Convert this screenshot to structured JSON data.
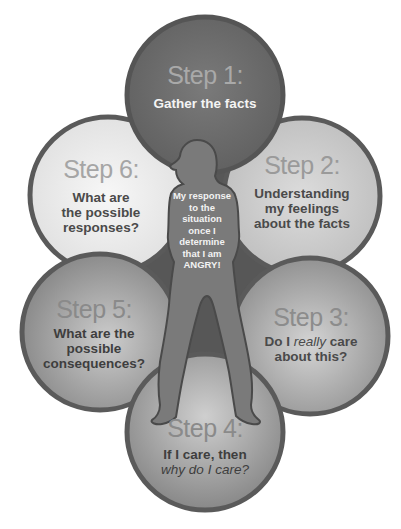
{
  "diagram": {
    "center": {
      "lines": [
        "My response",
        "to the",
        "situation",
        "once I",
        "determine",
        "that I am",
        "ANGRY!"
      ]
    },
    "steps": [
      {
        "number": "Step 1:",
        "lines": [
          "Gather the facts"
        ],
        "fill": "#6e6e6e",
        "text_color": "#f4f4f4",
        "step_color": "#a9a9a9"
      },
      {
        "number": "Step 2:",
        "lines": [
          "Understanding",
          "my feelings",
          "about the facts"
        ],
        "fill": "#c8c8c8",
        "text_color": "#4a4a4a",
        "step_color": "#9a9a9a"
      },
      {
        "number": "Step 3:",
        "line1_pre": "Do I ",
        "line1_em": "really",
        "line1_post": " care",
        "line2": "about this?",
        "fill": "#a8a8a8",
        "text_color": "#4a4a4a",
        "step_color": "#8c8c8c"
      },
      {
        "number": "Step 4:",
        "line1": "If I care, then",
        "line2_em": "why do I care?",
        "fill": "#a0a0a0",
        "text_color": "#3e3e3e",
        "step_color": "#8a8a8a"
      },
      {
        "number": "Step 5:",
        "lines": [
          "What are the",
          "possible",
          "consequences?"
        ],
        "fill": "#9a9a9a",
        "text_color": "#3e3e3e",
        "step_color": "#8a8a8a"
      },
      {
        "number": "Step 6:",
        "lines": [
          "What are",
          "the possible",
          "responses?"
        ],
        "fill": "#ebebeb",
        "text_color": "#4a4a4a",
        "step_color": "#a5a5a5"
      }
    ],
    "colors": {
      "outline": "#5a5a5a",
      "backdrop": "#555555",
      "silhouette": "#787878",
      "silhouette_edge": "#4c4c4c"
    }
  }
}
